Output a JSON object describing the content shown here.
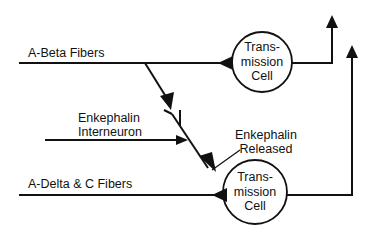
{
  "diagram": {
    "type": "neural pathway / gate control schematic",
    "stroke_color": "#111111",
    "background": "#ffffff",
    "labels": {
      "a_beta": "A-Beta Fibers",
      "a_delta_c": "A-Delta & C Fibers",
      "interneuron_line1": "Enkephalin",
      "interneuron_line2": "Interneuron",
      "released_line1": "Enkephalin",
      "released_line2": "Released"
    },
    "cells": [
      {
        "id": "top",
        "line1": "Trans-",
        "line2": "mission",
        "line3": "Cell"
      },
      {
        "id": "bottom",
        "line1": "Trans-",
        "line2": "mission",
        "line3": "Cell"
      }
    ]
  }
}
